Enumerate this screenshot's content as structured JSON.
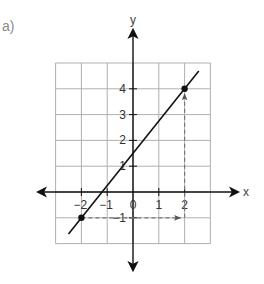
{
  "part_label": "a)",
  "axes": {
    "x_label": "x",
    "y_label": "y",
    "x_ticks": [
      {
        "value": -2,
        "label": "−2"
      },
      {
        "value": -1,
        "label": "−1"
      },
      {
        "value": 0,
        "label": "0"
      },
      {
        "value": 1,
        "label": "1"
      },
      {
        "value": 2,
        "label": "2"
      }
    ],
    "y_ticks": [
      {
        "value": 4,
        "label": "4"
      },
      {
        "value": 3,
        "label": "3"
      },
      {
        "value": 2,
        "label": "2"
      },
      {
        "value": 1,
        "label": "1"
      },
      {
        "value": -1,
        "label": "−1"
      }
    ],
    "grid_x_range": [
      -3,
      3
    ],
    "grid_y_range": [
      -2,
      5
    ]
  },
  "line": {
    "slope": 1.25,
    "intercept": 1.5,
    "from_x": -2.5,
    "to_x": 2.55
  },
  "points": [
    {
      "x": -2,
      "y": -1
    },
    {
      "x": 2,
      "y": 4
    }
  ],
  "dashed_path": [
    {
      "from": [
        -2,
        -1
      ],
      "to": [
        2,
        -1
      ],
      "arrow": true
    },
    {
      "from": [
        2,
        -1
      ],
      "to": [
        2,
        4
      ],
      "arrow": true
    }
  ],
  "colors": {
    "grid": "#b0b0b0",
    "axis": "#111111",
    "line": "#111111",
    "dashed": "#777777"
  }
}
